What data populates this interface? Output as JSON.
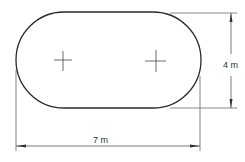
{
  "diagram": {
    "shape": "stadium",
    "dimensions": {
      "width_label": "7 m",
      "height_label": "4 m"
    },
    "markers": [
      {
        "name": "left-center-crosshair"
      },
      {
        "name": "right-center-crosshair"
      }
    ],
    "colors": {
      "stroke": "#2a2a2a",
      "dim_line": "#555555",
      "background": "#ffffff"
    }
  }
}
